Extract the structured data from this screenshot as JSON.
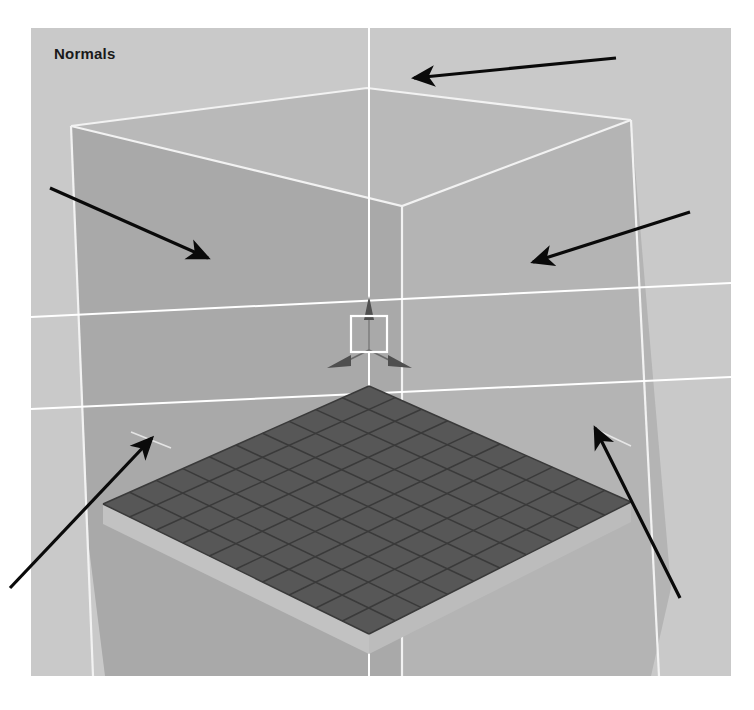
{
  "figure": {
    "background_color": "#ffffff",
    "width": 754,
    "height": 710
  },
  "viewport": {
    "label": "Normals",
    "background_color": "#c9c9c9",
    "bounds": {
      "x": 31,
      "y": 28,
      "width": 700,
      "height": 648
    }
  },
  "scene": {
    "title": "Normals",
    "description": "Perspective 3D viewport showing the inside of a large box (room) with a dark checkered ground plane and an axis tripod at the origin.",
    "box": {
      "name": "room-box",
      "left_wall_color": "#a9a9a9",
      "right_wall_color": "#b4b4b4",
      "ceiling_color": "#b9b9b9",
      "edge_color": "#f2f2f2",
      "outside_color": "#c9c9c9"
    },
    "ground_plane": {
      "name": "grid-plane",
      "fill_color": "#575757",
      "line_color": "#3a3a3a",
      "side_color": "#c0c0c0",
      "rows": 10,
      "columns": 10
    },
    "world_lines": {
      "color": "#ffffff",
      "vertical_count": 1,
      "horizontal_count": 2
    },
    "axis_gizmo": {
      "name": "axis-tripod",
      "color": "#5a5a5a",
      "selection_box_color": "#ffffff",
      "axes": [
        "Y-up",
        "X-right",
        "Z-left"
      ]
    }
  },
  "annotations": {
    "arrow_color": "#0a0a0a",
    "arrows": [
      {
        "id": "arrow-ceiling",
        "label": "ceiling-normal-arrow",
        "points_to": "ceiling",
        "x1": 616,
        "y1": 58,
        "x2": 414,
        "y2": 78
      },
      {
        "id": "arrow-left-wall",
        "label": "left-wall-normal-arrow",
        "points_to": "left wall",
        "x1": 50,
        "y1": 188,
        "x2": 208,
        "y2": 258
      },
      {
        "id": "arrow-right-wall",
        "label": "right-wall-normal-arrow",
        "points_to": "right wall",
        "x1": 690,
        "y1": 212,
        "x2": 533,
        "y2": 262
      },
      {
        "id": "arrow-floor-left",
        "label": "floor-left-normal-arrow",
        "points_to": "floor left corner",
        "x1": 10,
        "y1": 588,
        "x2": 152,
        "y2": 438
      },
      {
        "id": "arrow-floor-right",
        "label": "floor-right-normal-arrow",
        "points_to": "floor right corner",
        "x1": 680,
        "y1": 598,
        "x2": 595,
        "y2": 428
      }
    ]
  }
}
